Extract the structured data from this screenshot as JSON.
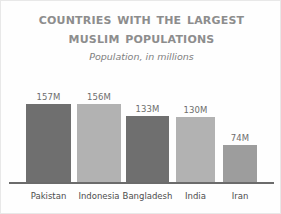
{
  "chart_data": {
    "type": "bar",
    "title": "Countries with the Largest Muslim Populations",
    "title_line_1": "Countries with the Largest",
    "title_line_2": "Muslim Populations",
    "subtitle": "Population, in millions",
    "xlabel": "",
    "ylabel": "Population, in millions",
    "ylim": [
      0,
      170
    ],
    "grid": false,
    "legend": false,
    "categories": [
      "Pakistan",
      "Indonesia",
      "Bangladesh",
      "India",
      "Iran"
    ],
    "values": [
      157,
      156,
      133,
      130,
      74
    ],
    "value_labels": [
      "157M",
      "156M",
      "133M",
      "130M",
      "74M"
    ],
    "unit_suffix": "M",
    "bar_colors": [
      "#6f6f6f",
      "#b2b2b2",
      "#6f6f6f",
      "#b2b2b2",
      "#9d9d9d"
    ],
    "bars": [
      {
        "category": "Pakistan",
        "value": 157,
        "label": "157M",
        "color": "#6f6f6f",
        "left": 25,
        "width": 45
      },
      {
        "category": "Indonesia",
        "value": 156,
        "label": "156M",
        "color": "#b2b2b2",
        "left": 76,
        "width": 44
      },
      {
        "category": "Bangladesh",
        "value": 133,
        "label": "133M",
        "color": "#6f6f6f",
        "left": 125,
        "width": 43
      },
      {
        "category": "India",
        "value": 130,
        "label": "130M",
        "color": "#b2b2b2",
        "left": 175,
        "width": 39
      },
      {
        "category": "Iran",
        "value": 74,
        "label": "74M",
        "color": "#9d9d9d",
        "left": 222,
        "width": 34
      }
    ]
  },
  "style": {
    "title_color": "#8d8d8d",
    "subtitle_color": "#808080",
    "axis_color": "#6b6b6b",
    "category_label_color": "#4d4d4d",
    "value_label_color": "#6d6d6d",
    "background": "#fefefe"
  }
}
